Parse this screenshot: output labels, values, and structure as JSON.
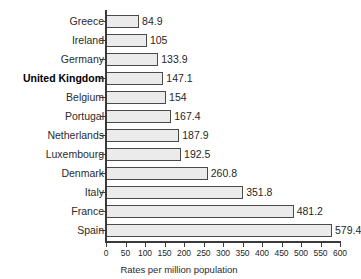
{
  "chart_data": {
    "type": "bar",
    "orientation": "horizontal",
    "title": "",
    "subtitle": "",
    "xlabel": "Rates per million population",
    "ylabel": "",
    "categories": [
      "Greece",
      "Ireland",
      "Germany",
      "United Kingdom",
      "Belgium",
      "Portugal",
      "Netherlands",
      "Luxembourg",
      "Denmark",
      "Italy",
      "France",
      "Spain"
    ],
    "values": [
      84.9,
      105,
      133.9,
      147.1,
      154,
      167.4,
      187.9,
      192.5,
      260.8,
      351.8,
      481.2,
      579.4
    ],
    "value_labels": [
      "84.9",
      "105",
      "133.9",
      "147.1",
      "154",
      "167.4",
      "187.9",
      "192.5",
      "260.8",
      "351.8",
      "481.2",
      "579.4"
    ],
    "highlighted_category": "United Kingdom",
    "xlim": [
      0,
      600
    ],
    "x_ticks": [
      0,
      50,
      100,
      150,
      200,
      250,
      300,
      350,
      400,
      450,
      500,
      550,
      600
    ],
    "x_tick_labels": [
      "0",
      "50",
      "100",
      "150",
      "200",
      "250",
      "300",
      "350",
      "400",
      "450",
      "500",
      "550",
      "600"
    ],
    "grid": false,
    "legend": null,
    "bar_fill_color": "#ebebeb",
    "bar_border_color": "#4a4a4a",
    "axis_color": "#3a3a3a"
  }
}
